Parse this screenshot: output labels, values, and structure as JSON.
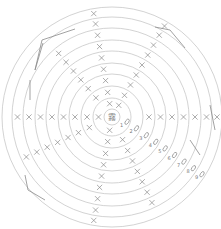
{
  "diagram": {
    "center": {
      "x": 112,
      "y": 117
    },
    "ring_radii": [
      8,
      19,
      31,
      43,
      54,
      66,
      77,
      89,
      100,
      110
    ],
    "ring_color": "#c8c8c8",
    "mark_color": "#8a8a8a",
    "center_glyph": "霧",
    "x_rays": [
      {
        "angle_deg": -100,
        "start_ring": 1,
        "end_ring": 9
      },
      {
        "angle_deg": -60,
        "start_ring": 1,
        "end_ring": 9
      },
      {
        "angle_deg": -130,
        "start_ring": 2,
        "end_ring": 7
      },
      {
        "angle_deg": 180,
        "start_ring": 1,
        "end_ring": 8
      },
      {
        "angle_deg": 0,
        "start_ring": 3,
        "end_ring": 9
      },
      {
        "angle_deg": 155,
        "start_ring": 2,
        "end_ring": 8
      },
      {
        "angle_deg": 100,
        "start_ring": 1,
        "end_ring": 9
      },
      {
        "angle_deg": 65,
        "start_ring": 2,
        "end_ring": 8
      }
    ],
    "numbered_labels": [
      {
        "n": "1",
        "ring": 1
      },
      {
        "n": "2",
        "ring": 2
      },
      {
        "n": "3",
        "ring": 3
      },
      {
        "n": "4",
        "ring": 4
      },
      {
        "n": "5",
        "ring": 5
      },
      {
        "n": "6",
        "ring": 6
      },
      {
        "n": "7",
        "ring": 7
      },
      {
        "n": "8",
        "ring": 8
      },
      {
        "n": "9",
        "ring": 9
      }
    ],
    "label_angle_deg": 35,
    "brackets": [
      {
        "points": [
          [
            43,
            43
          ],
          [
            35,
            70
          ],
          [
            42,
            40
          ],
          [
            75,
            29
          ]
        ]
      },
      {
        "points": [
          [
            30,
            80
          ],
          [
            30,
            100
          ]
        ]
      },
      {
        "points": [
          [
            155,
            27
          ],
          [
            170,
            30
          ],
          [
            185,
            48
          ]
        ]
      },
      {
        "points": [
          [
            25,
            175
          ],
          [
            28,
            190
          ],
          [
            45,
            200
          ]
        ]
      },
      {
        "points": [
          [
            210,
            105
          ],
          [
            215,
            130
          ]
        ]
      },
      {
        "points": [
          [
            190,
            140
          ],
          [
            200,
            155
          ]
        ]
      }
    ]
  }
}
